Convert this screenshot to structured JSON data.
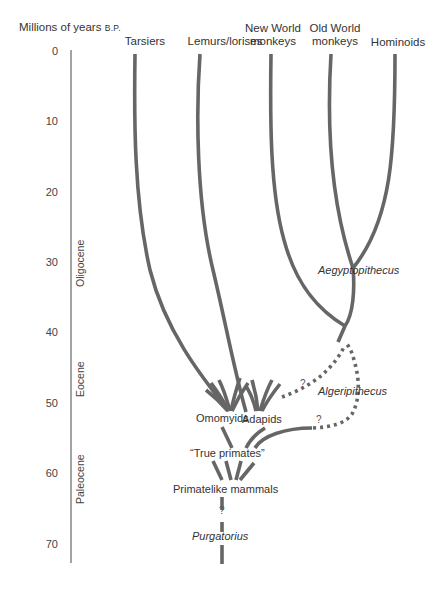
{
  "axis": {
    "title": "Millions of years",
    "title_suffix": "B.P.",
    "ticks": [
      "0",
      "10",
      "20",
      "30",
      "40",
      "50",
      "60",
      "70"
    ],
    "epochs": [
      "Oligocene",
      "Eocene",
      "Paleocene"
    ]
  },
  "taxa": {
    "tarsiers": "Tarsiers",
    "lemurs": "Lemurs/lorises",
    "new_world_1": "New World",
    "new_world_2": "monkeys",
    "old_world_1": "Old World",
    "old_world_2": "monkeys",
    "hominoids": "Hominoids"
  },
  "nodes": {
    "aegyptopithecus": "Aegyptopithecus",
    "algeripithecus": "Algeripithecus",
    "omomyids": "Omomyids",
    "adapids": "Adapids",
    "true_primates": "“True primates”",
    "primatelike": "Primatelike mammals",
    "purgatorius": "Purgatorius",
    "uncertain": "?"
  },
  "colors": {
    "line": "#666666",
    "text": "#333333",
    "background": "#ffffff"
  }
}
